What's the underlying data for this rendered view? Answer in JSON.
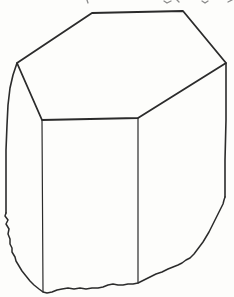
{
  "figure": {
    "name": "hexagonal-prism-crystal",
    "paper_color": "#fdfdfb",
    "ink_color": "#2b2b2b",
    "fragment_color": "#8a8a8a",
    "canvas": {
      "width": 234,
      "height": 297
    },
    "top_face": {
      "stroke_width": 1.8,
      "points": [
        [
          17,
          63
        ],
        [
          92,
          13
        ],
        [
          183,
          11
        ],
        [
          226,
          63
        ],
        [
          138,
          118
        ],
        [
          42,
          120
        ]
      ]
    },
    "edges": [
      {
        "name": "left-outer-edge",
        "stroke_width": 1.6,
        "points": [
          [
            17,
            63
          ],
          [
            13,
            75
          ],
          [
            10,
            88
          ],
          [
            8,
            105
          ],
          [
            7,
            125
          ],
          [
            6,
            150
          ],
          [
            6,
            180
          ],
          [
            6,
            213
          ]
        ]
      },
      {
        "name": "front-left-edge",
        "stroke_width": 1.2,
        "points": [
          [
            42,
            120
          ],
          [
            43,
            292
          ]
        ]
      },
      {
        "name": "front-middle-edge",
        "stroke_width": 1.2,
        "points": [
          [
            138,
            118
          ],
          [
            138,
            283
          ]
        ]
      },
      {
        "name": "right-outer-edge",
        "stroke_width": 1.6,
        "points": [
          [
            226,
            63
          ],
          [
            226,
            120
          ],
          [
            225,
            160
          ],
          [
            225,
            197
          ]
        ]
      }
    ],
    "fracture_outline": {
      "stroke_width": 1.5,
      "points": [
        [
          6,
          213
        ],
        [
          5,
          216
        ],
        [
          8,
          220
        ],
        [
          6,
          224
        ],
        [
          9,
          229
        ],
        [
          8,
          234
        ],
        [
          10,
          239
        ],
        [
          10,
          244
        ],
        [
          12,
          248
        ],
        [
          12,
          252
        ],
        [
          15,
          257
        ],
        [
          16,
          261
        ],
        [
          19,
          266
        ],
        [
          22,
          271
        ],
        [
          26,
          276
        ],
        [
          30,
          281
        ],
        [
          34,
          285
        ],
        [
          39,
          289
        ],
        [
          43,
          292
        ],
        [
          47,
          293
        ],
        [
          52,
          292
        ],
        [
          57,
          290
        ],
        [
          62,
          289
        ],
        [
          68,
          288
        ],
        [
          74,
          289
        ],
        [
          80,
          288
        ],
        [
          86,
          289
        ],
        [
          92,
          288
        ],
        [
          98,
          288
        ],
        [
          103,
          287
        ],
        [
          108,
          285
        ],
        [
          113,
          284
        ],
        [
          118,
          285
        ],
        [
          123,
          285
        ],
        [
          128,
          284
        ],
        [
          133,
          284
        ],
        [
          138,
          283
        ],
        [
          144,
          280
        ],
        [
          150,
          277
        ],
        [
          156,
          274
        ],
        [
          162,
          272
        ],
        [
          168,
          269
        ],
        [
          173,
          267
        ],
        [
          178,
          265
        ],
        [
          182,
          263
        ],
        [
          186,
          260
        ],
        [
          190,
          258
        ],
        [
          194,
          254
        ],
        [
          197,
          250
        ],
        [
          200,
          246
        ],
        [
          203,
          242
        ],
        [
          206,
          237
        ],
        [
          209,
          232
        ],
        [
          211,
          228
        ],
        [
          213,
          224
        ],
        [
          215,
          220
        ],
        [
          217,
          216
        ],
        [
          219,
          212
        ],
        [
          221,
          208
        ],
        [
          223,
          204
        ],
        [
          224,
          200
        ],
        [
          225,
          197
        ]
      ]
    },
    "page_fragments": [
      {
        "name": "cropped-descender-1",
        "stroke_width": 1.3,
        "points": [
          [
            87,
            0
          ],
          [
            88,
            3
          ]
        ]
      },
      {
        "name": "cropped-descender-2",
        "stroke_width": 1.3,
        "points": [
          [
            164,
            1
          ],
          [
            167,
            3
          ],
          [
            171,
            1
          ]
        ]
      },
      {
        "name": "cropped-descender-3",
        "stroke_width": 1.3,
        "points": [
          [
            177,
            0
          ],
          [
            179,
            2
          ]
        ]
      },
      {
        "name": "cropped-descender-4",
        "stroke_width": 1.3,
        "points": [
          [
            202,
            1
          ],
          [
            205,
            3
          ],
          [
            208,
            1
          ]
        ]
      },
      {
        "name": "cropped-descender-5",
        "stroke_width": 1.3,
        "points": [
          [
            228,
            2
          ],
          [
            232,
            0
          ]
        ]
      }
    ]
  }
}
